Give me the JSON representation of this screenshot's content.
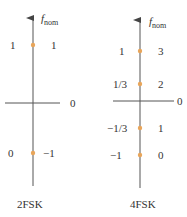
{
  "diagrams": [
    {
      "caption": "2FSK",
      "axis_label": "f",
      "axis_label_sub": "nom",
      "zero_label": "0",
      "levels": [
        {
          "left": "1",
          "right": "1"
        },
        {
          "left": "0",
          "right": "−1"
        }
      ]
    },
    {
      "caption": "4FSK",
      "axis_label": "f",
      "axis_label_sub": "nom",
      "zero_label": "0",
      "levels": [
        {
          "left": "1",
          "right": "3"
        },
        {
          "left": "1/3",
          "right": "2"
        },
        {
          "left": "−1/3",
          "right": "1"
        },
        {
          "left": "−1",
          "right": "0"
        }
      ]
    }
  ],
  "colors": {
    "axis": "#444444",
    "dot": "#e8a55a"
  }
}
